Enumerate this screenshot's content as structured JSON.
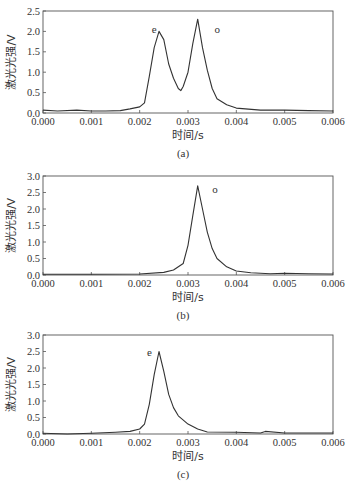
{
  "chart_data": [
    {
      "type": "line",
      "caption": "(a)",
      "xlabel": "时间/s",
      "ylabel": "激光光强/V",
      "xlim": [
        0,
        0.006
      ],
      "ylim": [
        0,
        2.5
      ],
      "xticks": [
        "0.000",
        "0.001",
        "0.002",
        "0.003",
        "0.004",
        "0.005",
        "0.006"
      ],
      "yticks": [
        "0.0",
        "0.5",
        "1.0",
        "1.5",
        "2.0",
        "2.5"
      ],
      "annotations": [
        {
          "text": "e",
          "x": 0.00225,
          "y": 1.95
        },
        {
          "text": "o",
          "x": 0.00355,
          "y": 1.95
        }
      ],
      "x": [
        0.0,
        0.0003,
        0.0007,
        0.001,
        0.0013,
        0.0016,
        0.0018,
        0.002,
        0.0021,
        0.0022,
        0.0023,
        0.0024,
        0.0025,
        0.0026,
        0.0027,
        0.0028,
        0.00285,
        0.0029,
        0.003,
        0.0031,
        0.0032,
        0.0033,
        0.0034,
        0.0035,
        0.0036,
        0.0038,
        0.004,
        0.0045,
        0.005,
        0.0055,
        0.006
      ],
      "values": [
        0.07,
        0.05,
        0.07,
        0.05,
        0.05,
        0.06,
        0.1,
        0.15,
        0.25,
        0.9,
        1.6,
        2.0,
        1.8,
        1.2,
        0.85,
        0.6,
        0.55,
        0.65,
        1.0,
        1.7,
        2.3,
        1.6,
        1.05,
        0.6,
        0.35,
        0.2,
        0.12,
        0.07,
        0.07,
        0.06,
        0.05
      ]
    },
    {
      "type": "line",
      "caption": "(b)",
      "xlabel": "时间/s",
      "ylabel": "激光光强/V",
      "xlim": [
        0,
        0.006
      ],
      "ylim": [
        0,
        3.0
      ],
      "xticks": [
        "0.000",
        "0.001",
        "0.002",
        "0.003",
        "0.004",
        "0.005",
        "0.006"
      ],
      "yticks": [
        "0.0",
        "0.5",
        "1.0",
        "1.5",
        "2.0",
        "2.5",
        "3.0"
      ],
      "annotations": [
        {
          "text": "o",
          "x": 0.0035,
          "y": 2.5
        }
      ],
      "x": [
        0.0,
        0.001,
        0.002,
        0.0025,
        0.0027,
        0.0029,
        0.003,
        0.0031,
        0.0032,
        0.0033,
        0.0034,
        0.0035,
        0.0036,
        0.0038,
        0.004,
        0.0043,
        0.0047,
        0.005,
        0.0055,
        0.006
      ],
      "values": [
        0.02,
        0.02,
        0.03,
        0.08,
        0.15,
        0.35,
        0.9,
        1.8,
        2.7,
        2.0,
        1.3,
        0.8,
        0.5,
        0.25,
        0.12,
        0.07,
        0.04,
        0.05,
        0.04,
        0.03
      ]
    },
    {
      "type": "line",
      "caption": "(c)",
      "xlabel": "时间/s",
      "ylabel": "激光光强/V",
      "xlim": [
        0,
        0.006
      ],
      "ylim": [
        0,
        3.0
      ],
      "xticks": [
        "0.000",
        "0.001",
        "0.002",
        "0.003",
        "0.004",
        "0.005",
        "0.006"
      ],
      "yticks": [
        "0.0",
        "0.5",
        "1.0",
        "1.5",
        "2.0",
        "2.5",
        "3.0"
      ],
      "annotations": [
        {
          "text": "e",
          "x": 0.00215,
          "y": 2.35
        }
      ],
      "x": [
        0.0,
        0.0005,
        0.001,
        0.0015,
        0.0018,
        0.002,
        0.0021,
        0.0022,
        0.0023,
        0.0024,
        0.0025,
        0.0026,
        0.0027,
        0.0028,
        0.003,
        0.0032,
        0.0034,
        0.004,
        0.0045,
        0.0046,
        0.005,
        0.0055,
        0.006
      ],
      "values": [
        0.02,
        0.0,
        0.02,
        0.05,
        0.08,
        0.15,
        0.3,
        0.9,
        1.8,
        2.5,
        1.9,
        1.2,
        0.8,
        0.55,
        0.3,
        0.15,
        0.06,
        0.05,
        0.03,
        0.08,
        0.03,
        0.03,
        0.03
      ]
    }
  ]
}
